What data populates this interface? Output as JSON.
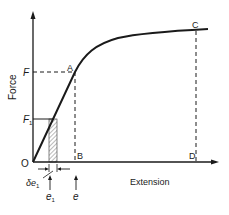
{
  "diagram": {
    "type": "force-extension graph",
    "axes": {
      "y_label": "Force",
      "x_label": "Extension",
      "origin_label": "O"
    },
    "points": {
      "A": "A",
      "B": "B",
      "C": "C",
      "D": "D"
    },
    "force_labels": {
      "F": "F",
      "F1_main": "F",
      "F1_sub": "1"
    },
    "extension_labels": {
      "delta_e1_main": "δe",
      "delta_e1_sub": "1",
      "e1_main": "e",
      "e1_sub": "1",
      "e": "e"
    },
    "colors": {
      "ink": "#1a1a1a",
      "background": "#ffffff"
    }
  }
}
